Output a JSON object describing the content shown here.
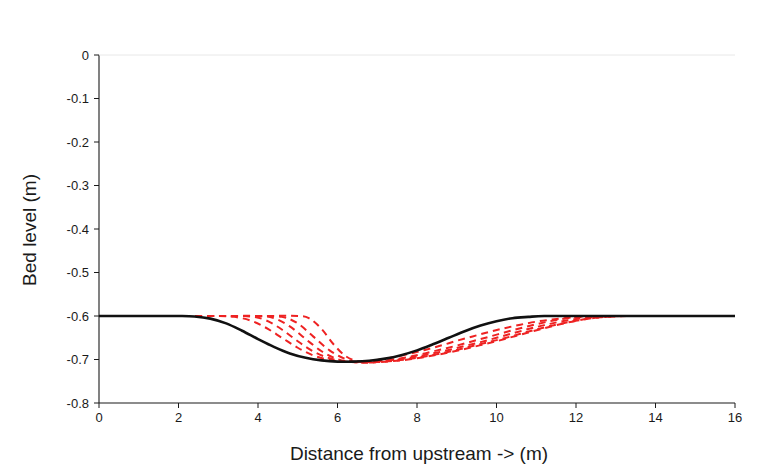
{
  "chart_data": {
    "type": "line",
    "title": "Along river profile",
    "xlabel": "Distance from upstream -> (m)",
    "ylabel": "Bed level (m)",
    "xlim": [
      0,
      16
    ],
    "ylim": [
      -0.8,
      0
    ],
    "xticks": [
      0,
      2,
      4,
      6,
      8,
      10,
      12,
      14,
      16
    ],
    "xtick_labels": [
      "0",
      "2",
      "4",
      "6",
      "8",
      "10",
      "12",
      "14",
      "16"
    ],
    "yticks": [
      0,
      -0.1,
      -0.2,
      -0.3,
      -0.4,
      -0.5,
      -0.6,
      -0.7,
      -0.8
    ],
    "ytick_labels": [
      "0",
      "-0.1",
      "-0.2",
      "-0.3",
      "-0.4",
      "-0.5",
      "-0.6",
      "-0.7",
      "-0.8"
    ],
    "grid": false,
    "legend": "none",
    "initial_bed_level": -0.6,
    "scour_min_level": -0.705,
    "colors": {
      "initial_profile": "#111111",
      "evolving_profile": "#ee2222",
      "axis": "#1a1a1a",
      "background": "#ffffff"
    },
    "series": [
      {
        "name": "Initial profile",
        "style": "solid",
        "color": "#111111",
        "x": [
          0.0,
          0.5,
          1.0,
          1.5,
          2.0,
          2.4,
          2.8,
          3.2,
          3.6,
          4.0,
          4.4,
          4.8,
          5.2,
          5.6,
          6.0,
          6.4,
          6.8,
          7.2,
          7.6,
          8.0,
          8.4,
          8.8,
          9.2,
          9.6,
          10.0,
          10.4,
          10.8,
          11.2,
          12.0,
          13.0,
          14.0,
          15.0,
          16.0
        ],
        "y": [
          -0.6,
          -0.6,
          -0.6,
          -0.6,
          -0.6,
          -0.601,
          -0.606,
          -0.617,
          -0.634,
          -0.653,
          -0.671,
          -0.686,
          -0.696,
          -0.702,
          -0.705,
          -0.705,
          -0.703,
          -0.698,
          -0.69,
          -0.679,
          -0.665,
          -0.65,
          -0.635,
          -0.622,
          -0.612,
          -0.605,
          -0.602,
          -0.6,
          -0.6,
          -0.6,
          -0.6,
          -0.6,
          -0.6
        ]
      },
      {
        "name": "Profile t1",
        "style": "dashed",
        "color": "#ee2222",
        "x": [
          0.0,
          1.0,
          2.0,
          3.0,
          3.4,
          3.8,
          4.2,
          4.6,
          5.0,
          5.4,
          5.8,
          6.2,
          6.6,
          7.0,
          7.4,
          7.8,
          8.2,
          8.6,
          9.0,
          9.4,
          9.8,
          10.2,
          10.6,
          11.0,
          11.4,
          11.8,
          12.2,
          12.6,
          13.0,
          14.0,
          15.0,
          16.0
        ],
        "y": [
          -0.6,
          -0.6,
          -0.6,
          -0.6,
          -0.602,
          -0.61,
          -0.627,
          -0.65,
          -0.673,
          -0.691,
          -0.701,
          -0.705,
          -0.705,
          -0.701,
          -0.695,
          -0.687,
          -0.678,
          -0.668,
          -0.657,
          -0.647,
          -0.637,
          -0.628,
          -0.62,
          -0.613,
          -0.608,
          -0.604,
          -0.601,
          -0.6,
          -0.6,
          -0.6,
          -0.6,
          -0.6
        ]
      },
      {
        "name": "Profile t2",
        "style": "dashed",
        "color": "#ee2222",
        "x": [
          0.0,
          1.0,
          2.0,
          3.0,
          3.8,
          4.2,
          4.6,
          5.0,
          5.4,
          5.8,
          6.2,
          6.6,
          7.0,
          7.4,
          7.8,
          8.2,
          8.6,
          9.0,
          9.4,
          9.8,
          10.2,
          10.6,
          11.0,
          11.4,
          11.8,
          12.2,
          12.6,
          13.0,
          14.0,
          15.0,
          16.0
        ],
        "y": [
          -0.6,
          -0.6,
          -0.6,
          -0.6,
          -0.601,
          -0.61,
          -0.631,
          -0.658,
          -0.682,
          -0.697,
          -0.705,
          -0.706,
          -0.704,
          -0.7,
          -0.694,
          -0.686,
          -0.677,
          -0.668,
          -0.658,
          -0.648,
          -0.638,
          -0.628,
          -0.619,
          -0.611,
          -0.605,
          -0.602,
          -0.6,
          -0.6,
          -0.6,
          -0.6,
          -0.6
        ]
      },
      {
        "name": "Profile t3",
        "style": "dashed",
        "color": "#ee2222",
        "x": [
          0.0,
          1.0,
          2.0,
          3.0,
          4.0,
          4.4,
          4.8,
          5.2,
          5.6,
          6.0,
          6.4,
          6.8,
          7.2,
          7.6,
          8.0,
          8.4,
          8.8,
          9.2,
          9.6,
          10.0,
          10.4,
          10.8,
          11.2,
          11.6,
          12.0,
          12.4,
          12.8,
          13.2,
          14.0,
          15.0,
          16.0
        ],
        "y": [
          -0.6,
          -0.6,
          -0.6,
          -0.6,
          -0.6,
          -0.605,
          -0.624,
          -0.653,
          -0.681,
          -0.699,
          -0.706,
          -0.706,
          -0.703,
          -0.699,
          -0.693,
          -0.686,
          -0.678,
          -0.669,
          -0.66,
          -0.65,
          -0.64,
          -0.63,
          -0.621,
          -0.613,
          -0.607,
          -0.603,
          -0.601,
          -0.6,
          -0.6,
          -0.6,
          -0.6
        ]
      },
      {
        "name": "Profile t4",
        "style": "dashed",
        "color": "#ee2222",
        "x": [
          0.0,
          1.0,
          2.0,
          3.0,
          4.0,
          4.6,
          5.0,
          5.4,
          5.8,
          6.2,
          6.6,
          7.0,
          7.4,
          7.8,
          8.2,
          8.6,
          9.0,
          9.4,
          9.8,
          10.2,
          10.6,
          11.0,
          11.4,
          11.8,
          12.2,
          12.6,
          13.0,
          13.4,
          14.0,
          15.0,
          16.0
        ],
        "y": [
          -0.6,
          -0.6,
          -0.6,
          -0.6,
          -0.6,
          -0.602,
          -0.617,
          -0.648,
          -0.679,
          -0.699,
          -0.707,
          -0.706,
          -0.703,
          -0.699,
          -0.693,
          -0.686,
          -0.678,
          -0.669,
          -0.66,
          -0.651,
          -0.641,
          -0.631,
          -0.622,
          -0.614,
          -0.608,
          -0.603,
          -0.601,
          -0.6,
          -0.6,
          -0.6,
          -0.6
        ]
      },
      {
        "name": "Profile t5",
        "style": "dashed",
        "color": "#ee2222",
        "x": [
          0.0,
          1.0,
          2.0,
          3.0,
          4.0,
          5.0,
          5.3,
          5.6,
          5.9,
          6.2,
          6.5,
          6.8,
          7.2,
          7.6,
          8.0,
          8.4,
          8.8,
          9.2,
          9.6,
          10.0,
          10.4,
          10.8,
          11.2,
          11.6,
          12.0,
          12.4,
          12.8,
          13.2,
          13.6,
          14.0,
          15.0,
          16.0
        ],
        "y": [
          -0.6,
          -0.6,
          -0.6,
          -0.6,
          -0.6,
          -0.6,
          -0.606,
          -0.63,
          -0.665,
          -0.692,
          -0.704,
          -0.707,
          -0.705,
          -0.702,
          -0.697,
          -0.691,
          -0.684,
          -0.676,
          -0.667,
          -0.658,
          -0.648,
          -0.638,
          -0.628,
          -0.619,
          -0.611,
          -0.605,
          -0.602,
          -0.6,
          -0.6,
          -0.6,
          -0.6,
          -0.6
        ]
      }
    ]
  }
}
